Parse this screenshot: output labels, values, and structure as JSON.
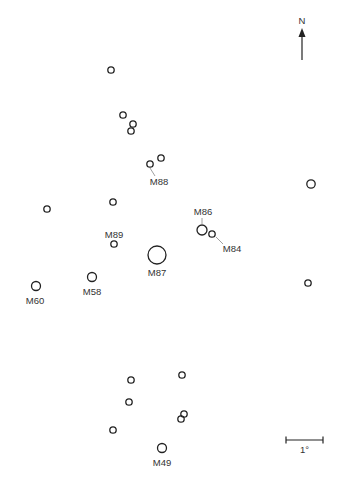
{
  "compass": {
    "label": "N",
    "x": 302,
    "y_label": 24,
    "y_top": 28,
    "y_bottom": 60
  },
  "scale_bar": {
    "label": "1°",
    "x1": 286,
    "x2": 323,
    "y": 440,
    "label_y": 453
  },
  "colors": {
    "stroke": "#222222",
    "text": "#333333",
    "leader": "#888888",
    "background": "#ffffff"
  },
  "objects": [
    {
      "name": "",
      "x": 111,
      "y": 70,
      "r": 3.2
    },
    {
      "name": "",
      "x": 123,
      "y": 115,
      "r": 3.2
    },
    {
      "name": "",
      "x": 133,
      "y": 124,
      "r": 3.2
    },
    {
      "name": "",
      "x": 131,
      "y": 131,
      "r": 3.2
    },
    {
      "name": "",
      "x": 150,
      "y": 164,
      "r": 3.2
    },
    {
      "name": "",
      "x": 161,
      "y": 158,
      "r": 3.2
    },
    {
      "name": "",
      "x": 113,
      "y": 202,
      "r": 3.2
    },
    {
      "name": "",
      "x": 47,
      "y": 209,
      "r": 3.2
    },
    {
      "name": "",
      "x": 311,
      "y": 184,
      "r": 4.2
    },
    {
      "name": "M86",
      "x": 202,
      "y": 230,
      "r": 5
    },
    {
      "name": "M84",
      "x": 212,
      "y": 234,
      "r": 3.2
    },
    {
      "name": "M89",
      "x": 114,
      "y": 244,
      "r": 3.2
    },
    {
      "name": "M87",
      "x": 157,
      "y": 255,
      "r": 9
    },
    {
      "name": "M58",
      "x": 92,
      "y": 277,
      "r": 4.5
    },
    {
      "name": "M60",
      "x": 36,
      "y": 286,
      "r": 4.5
    },
    {
      "name": "",
      "x": 308,
      "y": 283,
      "r": 3.2
    },
    {
      "name": "",
      "x": 131,
      "y": 380,
      "r": 3.2
    },
    {
      "name": "",
      "x": 182,
      "y": 375,
      "r": 3.2
    },
    {
      "name": "",
      "x": 129,
      "y": 402,
      "r": 3.2
    },
    {
      "name": "",
      "x": 184,
      "y": 414,
      "r": 3.2
    },
    {
      "name": "",
      "x": 181,
      "y": 419,
      "r": 3.2
    },
    {
      "name": "",
      "x": 113,
      "y": 430,
      "r": 3.2
    },
    {
      "name": "M49",
      "x": 162,
      "y": 448,
      "r": 4.5
    }
  ],
  "labels": [
    {
      "text": "M88",
      "x": 159,
      "y": 185,
      "leader": [
        150,
        168,
        155,
        176
      ]
    },
    {
      "text": "M86",
      "x": 203,
      "y": 215,
      "leader": [
        202,
        218,
        202,
        225
      ]
    },
    {
      "text": "M84",
      "x": 232,
      "y": 252,
      "leader": [
        216,
        237,
        223,
        244
      ]
    },
    {
      "text": "M89",
      "x": 114,
      "y": 238,
      "leader": null
    },
    {
      "text": "M87",
      "x": 157,
      "y": 276,
      "leader": null
    },
    {
      "text": "M58",
      "x": 92,
      "y": 295,
      "leader": null
    },
    {
      "text": "M60",
      "x": 35,
      "y": 304,
      "leader": null
    },
    {
      "text": "M49",
      "x": 162,
      "y": 466,
      "leader": null
    }
  ]
}
